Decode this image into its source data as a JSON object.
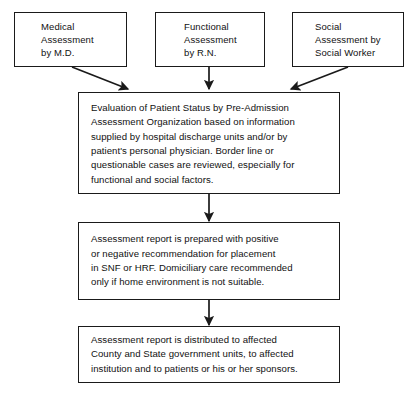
{
  "diagram": {
    "type": "flowchart",
    "orientation": "top-to-bottom",
    "line_color": "#1a1a1a",
    "background_color": "#ffffff",
    "nodes": [
      {
        "id": "medical",
        "shape": "rectangle",
        "text": "Medical\nAssessment\nby M.D."
      },
      {
        "id": "functional",
        "shape": "rectangle",
        "text": "Functional\nAssessment\nby R.N."
      },
      {
        "id": "social",
        "shape": "rectangle",
        "text": "Social\nAssessment by\nSocial Worker"
      },
      {
        "id": "evaluation",
        "shape": "rectangle",
        "text": "Evaluation of Patient Status by Pre-Admission\nAssessment Organization based on information\nsupplied by hospital discharge units and/or by\npatient's personal physician.  Border line or\nquestionable cases are reviewed, especially for\nfunctional and social factors."
      },
      {
        "id": "report",
        "shape": "rectangle",
        "text": "Assessment report is prepared with positive\nor negative recommendation for placement\nin SNF or HRF.  Domiciliary care recommended\nonly if home environment is not suitable."
      },
      {
        "id": "distribution",
        "shape": "rectangle",
        "text": "Assessment report is distributed to affected\nCounty and State government units, to affected\ninstitution and to patients or his or her sponsors."
      }
    ],
    "edges": [
      {
        "id": "medical-to-evaluation",
        "from": "medical",
        "to": "evaluation",
        "style": "diagonal-arrow"
      },
      {
        "id": "functional-to-evaluation",
        "from": "functional",
        "to": "evaluation",
        "style": "vertical-arrow"
      },
      {
        "id": "social-to-evaluation",
        "from": "social",
        "to": "evaluation",
        "style": "diagonal-arrow"
      },
      {
        "id": "evaluation-to-report",
        "from": "evaluation",
        "to": "report",
        "style": "vertical-arrow"
      },
      {
        "id": "report-to-distribution",
        "from": "report",
        "to": "distribution",
        "style": "vertical-arrow"
      }
    ]
  }
}
